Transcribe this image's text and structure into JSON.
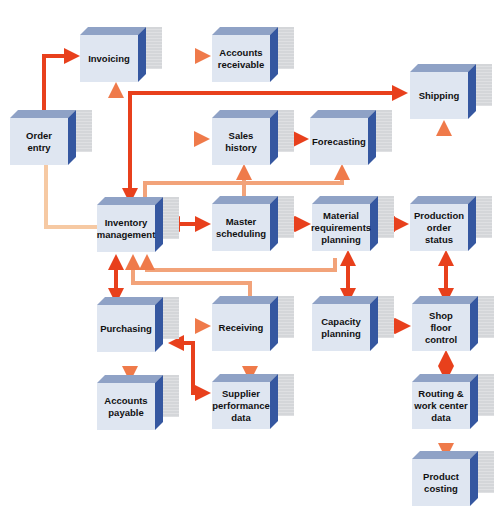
{
  "diagram": {
    "colors": {
      "box_face": "#dfe6f1",
      "box_top": "#8fa2c6",
      "box_side": "#3557a0",
      "box_shadow": "#d4d6d9",
      "arrow_strong": "#e8401c",
      "arrow_light": "#f4b98a"
    },
    "nodes": [
      {
        "id": "invoicing",
        "label": "Invoicing"
      },
      {
        "id": "accounts-receivable",
        "label": "Accounts\nreceivable"
      },
      {
        "id": "shipping",
        "label": "Shipping"
      },
      {
        "id": "order-entry",
        "label": "Order\nentry"
      },
      {
        "id": "sales-history",
        "label": "Sales\nhistory"
      },
      {
        "id": "forecasting",
        "label": "Forecasting"
      },
      {
        "id": "inventory-management",
        "label": "Inventory\nmanagement"
      },
      {
        "id": "master-scheduling",
        "label": "Master\nscheduling"
      },
      {
        "id": "material-requirements-planning",
        "label": "Material\nrequirements\nplanning"
      },
      {
        "id": "production-order-status",
        "label": "Production\norder\nstatus"
      },
      {
        "id": "purchasing",
        "label": "Purchasing"
      },
      {
        "id": "receiving",
        "label": "Receiving"
      },
      {
        "id": "capacity-planning",
        "label": "Capacity\nplanning"
      },
      {
        "id": "shop-floor-control",
        "label": "Shop\nfloor\ncontrol"
      },
      {
        "id": "accounts-payable",
        "label": "Accounts\npayable"
      },
      {
        "id": "supplier-performance-data",
        "label": "Supplier\nperformance\ndata"
      },
      {
        "id": "routing-work-center-data",
        "label": "Routing &\nwork center\ndata"
      },
      {
        "id": "product-costing",
        "label": "Product\ncosting"
      }
    ],
    "edges": [
      {
        "from": "order-entry",
        "to": "invoicing",
        "style": "strong",
        "direction": "one-way"
      },
      {
        "from": "invoicing",
        "to": "accounts-receivable",
        "style": "light",
        "direction": "one-way"
      },
      {
        "from": "order-entry",
        "to": "sales-history",
        "style": "light",
        "direction": "one-way"
      },
      {
        "from": "order-entry",
        "to": "inventory-management",
        "style": "light",
        "direction": "one-way"
      },
      {
        "from": "inventory-management",
        "to": "invoicing",
        "style": "light",
        "direction": "one-way"
      },
      {
        "from": "shipping",
        "to": "inventory-management",
        "style": "strong",
        "direction": "one-way"
      },
      {
        "from": "sales-history",
        "to": "forecasting",
        "style": "strong",
        "direction": "one-way"
      },
      {
        "from": "inventory-management",
        "to": "forecasting",
        "style": "light",
        "direction": "one-way"
      },
      {
        "from": "master-scheduling",
        "to": "sales-history",
        "style": "light",
        "direction": "one-way"
      },
      {
        "from": "inventory-management",
        "to": "master-scheduling",
        "style": "strong",
        "direction": "two-way"
      },
      {
        "from": "master-scheduling",
        "to": "material-requirements-planning",
        "style": "strong",
        "direction": "two-way"
      },
      {
        "from": "material-requirements-planning",
        "to": "production-order-status",
        "style": "strong",
        "direction": "two-way"
      },
      {
        "from": "production-order-status",
        "to": "shipping",
        "style": "light",
        "direction": "one-way"
      },
      {
        "from": "material-requirements-planning",
        "to": "inventory-management",
        "style": "light",
        "direction": "one-way"
      },
      {
        "from": "receiving",
        "to": "inventory-management",
        "style": "light",
        "direction": "one-way"
      },
      {
        "from": "inventory-management",
        "to": "purchasing",
        "style": "strong",
        "direction": "two-way"
      },
      {
        "from": "material-requirements-planning",
        "to": "capacity-planning",
        "style": "strong",
        "direction": "two-way"
      },
      {
        "from": "production-order-status",
        "to": "shop-floor-control",
        "style": "strong",
        "direction": "two-way"
      },
      {
        "from": "capacity-planning",
        "to": "shop-floor-control",
        "style": "strong",
        "direction": "two-way"
      },
      {
        "from": "purchasing",
        "to": "receiving",
        "style": "light",
        "direction": "one-way"
      },
      {
        "from": "purchasing",
        "to": "accounts-payable",
        "style": "light",
        "direction": "one-way"
      },
      {
        "from": "receiving",
        "to": "supplier-performance-data",
        "style": "light",
        "direction": "one-way"
      },
      {
        "from": "purchasing",
        "to": "supplier-performance-data",
        "style": "strong",
        "direction": "two-way"
      },
      {
        "from": "shop-floor-control",
        "to": "routing-work-center-data",
        "style": "strong",
        "direction": "two-way"
      },
      {
        "from": "routing-work-center-data",
        "to": "product-costing",
        "style": "light",
        "direction": "one-way"
      }
    ]
  }
}
